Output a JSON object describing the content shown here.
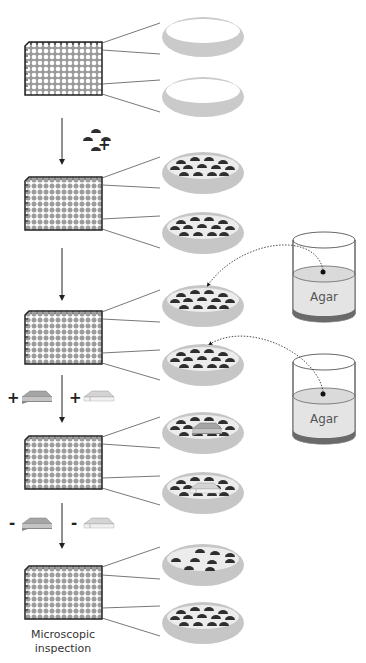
{
  "diagram": {
    "type": "workflow",
    "steps": [
      {
        "id": 1,
        "plate_wells": "empty",
        "dishes": [
          "empty-dish",
          "empty-dish"
        ]
      },
      {
        "id": 2,
        "operation": "+",
        "added": "organisms",
        "plate_wells": "filled",
        "dishes": [
          "organisms",
          "organisms"
        ]
      },
      {
        "id": 3,
        "operation": "add-agar",
        "plate_wells": "filled",
        "dishes": [
          "organisms + agar",
          "organisms + agar"
        ]
      },
      {
        "id": 4,
        "operation": "+",
        "added": [
          "dark-coverslip",
          "light-coverslip"
        ],
        "plate_wells": "filled",
        "dishes": [
          "with dark coverslip",
          "with light coverslip"
        ]
      },
      {
        "id": 5,
        "operation": "-",
        "removed": [
          "dark-coverslip",
          "light-coverslip"
        ],
        "plate_wells": "filled",
        "dishes": [
          "after removal",
          "after removal"
        ]
      }
    ],
    "operations": {
      "add_organisms": "+",
      "add_dark_coverslip": "+",
      "add_light_coverslip": "+",
      "remove_dark_coverslip": "-",
      "remove_light_coverslip": "-"
    },
    "beakers": [
      {
        "label": "Agar"
      },
      {
        "label": "Agar"
      }
    ],
    "caption": "Microscopic inspection",
    "caption_lines": [
      "Microscopic",
      "inspection"
    ],
    "colors": {
      "dish": "#c8c8c8",
      "dish_inner": "#e6e6e6",
      "organism": "#333333",
      "plate_outline": "#222222",
      "well_empty": "#ffffff",
      "well_filled": "#a0a0a0",
      "agar_liquid": "#e3e3e3",
      "agar_base": "#6a6a6a",
      "coverslip_dark": "#9a9a9a",
      "coverslip_light": "#dadada"
    }
  }
}
